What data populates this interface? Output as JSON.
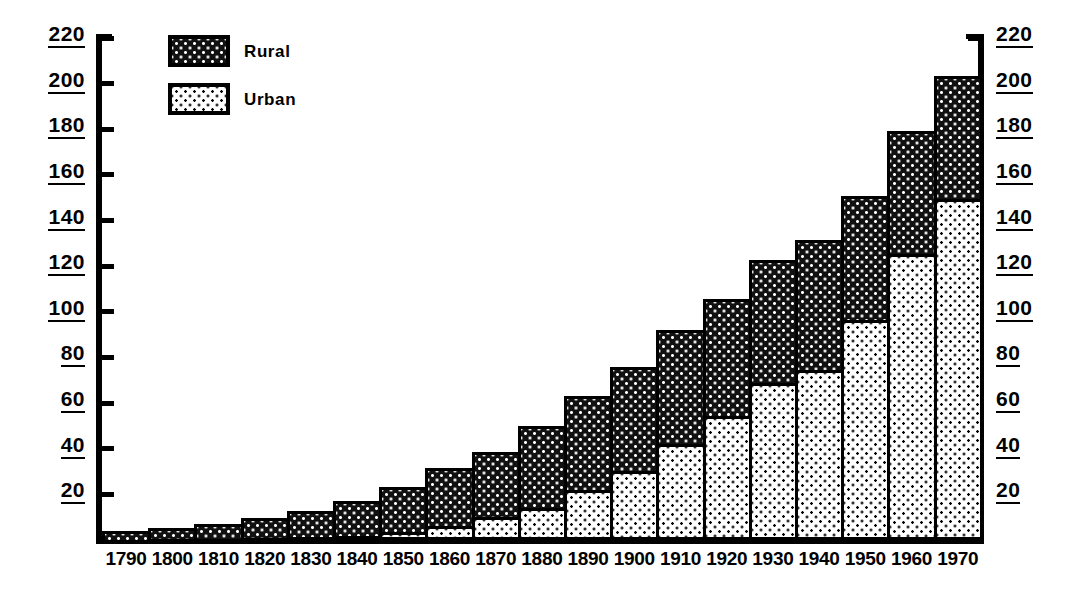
{
  "chart_data": {
    "type": "bar",
    "stacked": true,
    "title": "",
    "subtitle": "",
    "xlabel": "",
    "ylabel": "",
    "ylim": [
      0,
      220
    ],
    "ytick_step": 20,
    "grid": false,
    "legend_position": "top-left",
    "categories": [
      "1790",
      "1800",
      "1810",
      "1820",
      "1830",
      "1840",
      "1850",
      "1860",
      "1870",
      "1880",
      "1890",
      "1900",
      "1910",
      "1920",
      "1930",
      "1940",
      "1950",
      "1960",
      "1970"
    ],
    "series": [
      {
        "name": "Urban",
        "color": "#ffffff",
        "pattern": "black-dots-on-white",
        "values": [
          0.2,
          0.3,
          0.5,
          0.7,
          1.1,
          1.8,
          3.5,
          6.2,
          9.9,
          14.1,
          22.1,
          30.2,
          42.0,
          54.2,
          69.0,
          74.4,
          96.5,
          125.3,
          149.3
        ]
      },
      {
        "name": "Rural",
        "color": "#111111",
        "pattern": "white-dots-on-black",
        "values": [
          3.7,
          4.9,
          6.7,
          8.9,
          11.7,
          15.2,
          19.6,
          25.2,
          28.7,
          36.0,
          40.8,
          45.8,
          50.0,
          51.6,
          53.8,
          57.2,
          54.2,
          54.1,
          53.9
        ]
      }
    ],
    "totals": [
      3.9,
      5.2,
      7.2,
      9.6,
      12.8,
      17.0,
      23.1,
      31.4,
      38.6,
      50.1,
      62.9,
      76.0,
      92.0,
      105.8,
      122.8,
      131.6,
      150.7,
      179.4,
      203.2
    ],
    "ytick_labels_left": [
      "220",
      "200",
      "180",
      "160",
      "140",
      "120",
      "100",
      "80",
      "60",
      "40",
      "20"
    ],
    "ytick_labels_right": [
      "220",
      "200",
      "180",
      "160",
      "140",
      "120",
      "100",
      "80",
      "60",
      "40",
      "20"
    ],
    "ytick_values": [
      220,
      200,
      180,
      160,
      140,
      120,
      100,
      80,
      60,
      40,
      20
    ]
  },
  "legend": {
    "items": [
      {
        "label": "Rural",
        "swatch": "rural-swatch"
      },
      {
        "label": "Urban",
        "swatch": "urban-swatch"
      }
    ]
  }
}
